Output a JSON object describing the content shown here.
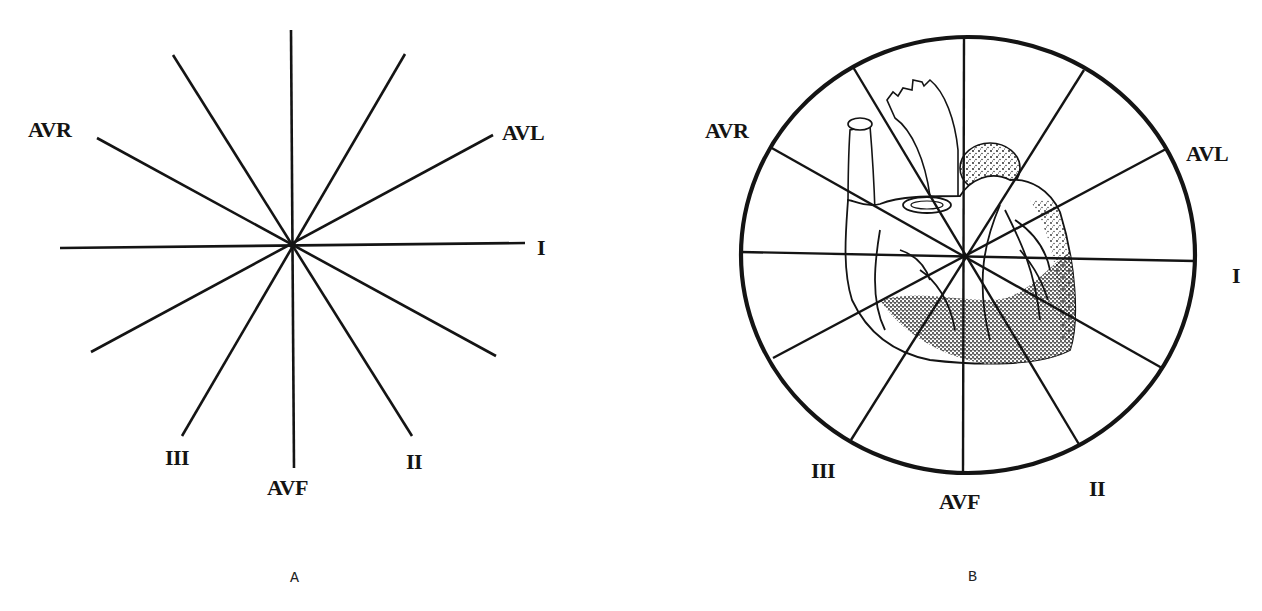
{
  "figure": {
    "type": "hexaxial reference system (ECG limb leads)",
    "colors": {
      "ink": "#141414",
      "background": "#ffffff"
    },
    "panel_a": {
      "caption": "A",
      "labels": {
        "avr": "AVR",
        "avl": "AVL",
        "i": "I",
        "ii": "II",
        "iii": "III",
        "avf": "AVF"
      },
      "spokes_count": 12,
      "description": "Six lead axes crossing at a common center, 30 degrees apart"
    },
    "panel_b": {
      "caption": "B",
      "labels": {
        "avr": "AVR",
        "avl": "AVL",
        "i": "I",
        "ii": "II",
        "iii": "III",
        "avf": "AVF"
      },
      "spokes_count": 12,
      "description": "Hexaxial spokes inside a circle overlaid on an anatomical heart drawing"
    }
  }
}
